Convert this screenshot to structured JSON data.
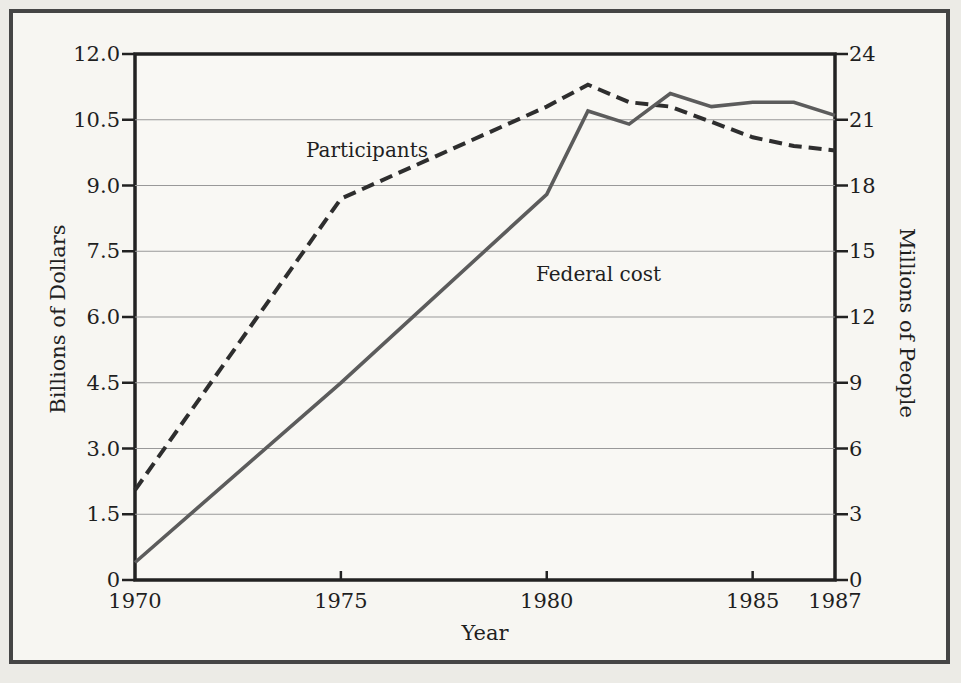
{
  "figure": {
    "x_axis_title": "Year",
    "left_axis_title": "Billions of Dollars",
    "right_axis_title": "Millions of People",
    "participants_label": "Participants",
    "federal_cost_label": "Federal cost"
  },
  "colors": {
    "paper": "#ecebe6",
    "panel": "#f7f6f2",
    "frame": "#454545",
    "axis_box": "#222222",
    "gridline": "#999999",
    "text": "#1f1f1f",
    "participants_line": "#2e2e2e",
    "federal_cost_line": "#5c5c5c"
  },
  "chart_data": {
    "type": "line",
    "x": [
      1970,
      1975,
      1980,
      1981,
      1982,
      1983,
      1984,
      1985,
      1986,
      1987
    ],
    "series": [
      {
        "name": "Participants",
        "axis": "right",
        "style": "dashed",
        "units": "millions of people",
        "values": [
          4.1,
          17.4,
          21.6,
          22.6,
          21.8,
          21.6,
          20.9,
          20.2,
          19.8,
          19.6
        ]
      },
      {
        "name": "Federal cost",
        "axis": "left",
        "style": "solid",
        "units": "billions of dollars",
        "values": [
          0.4,
          4.5,
          8.8,
          10.7,
          10.4,
          11.1,
          10.8,
          10.9,
          10.9,
          10.6
        ]
      }
    ],
    "x_range": [
      1970,
      1987
    ],
    "x_ticks": [
      "1970",
      "1975",
      "1980",
      "1985",
      "1987"
    ],
    "left_axis": {
      "label": "Billions of Dollars",
      "range": [
        0,
        12
      ],
      "ticks": [
        "0",
        "1.5",
        "3.0",
        "4.5",
        "6.0",
        "7.5",
        "9.0",
        "10.5",
        "12.0"
      ]
    },
    "right_axis": {
      "label": "Millions of People",
      "range": [
        0,
        24
      ],
      "ticks": [
        "0",
        "3",
        "6",
        "9",
        "12",
        "15",
        "18",
        "21",
        "24"
      ]
    },
    "xlabel": "Year",
    "grid": true,
    "legend": "inline-labels"
  }
}
